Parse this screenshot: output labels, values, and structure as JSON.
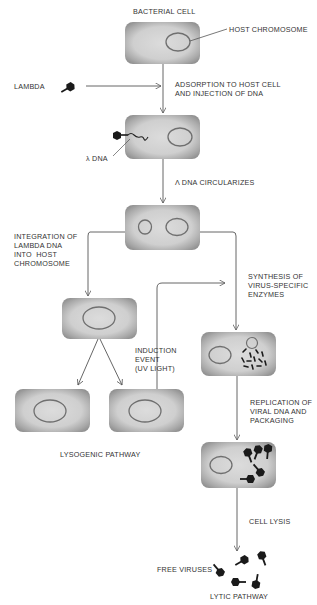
{
  "title": "Bacterial cell",
  "labels": {
    "bacterial_cell": "BACTERIAL CELL",
    "host_chromosome": "HOST CHROMOSOME",
    "lambda": "LAMBDA",
    "adsorption": "ADSORPTION TO HOST CELL\nAND INJECTION OF DNA",
    "lambda_dna": "λ DNA",
    "circularizes": "λ DNA CIRCULARIZES",
    "integration": "INTEGRATION OF\nLAMBDA DNA\nINTO  HOST\nCHROMOSOME",
    "synthesis": "SYNTHESIS OF\nVIRUS-SPECIFIC\nENZYMES",
    "induction": "INDUCTION\nEVENT\n(UV LIGHT)",
    "replication": "REPLICATION OF\nVIRAL DNA AND\nPACKAGING",
    "lysogenic_pathway": "LYSOGENIC PATHWAY",
    "cell_lysis": "CELL LYSIS",
    "free_viruses": "FREE VIRUSES",
    "lytic_pathway": "LYTIC PATHWAY"
  },
  "colors": {
    "cell_fill": "#c9c9c9",
    "cell_edge": "#8a8a8a",
    "chromosome": "#6f6f6f",
    "line": "#555555",
    "virus": "#1a1a1a"
  },
  "stages": [
    "bacterial-cell",
    "adsorption-and-injection",
    "dna-circularizes",
    "integration (lysogenic) / enzyme synthesis (lytic)",
    "cell division (lysogenic) / replication and packaging (lytic)",
    "cell lysis",
    "free viruses"
  ]
}
